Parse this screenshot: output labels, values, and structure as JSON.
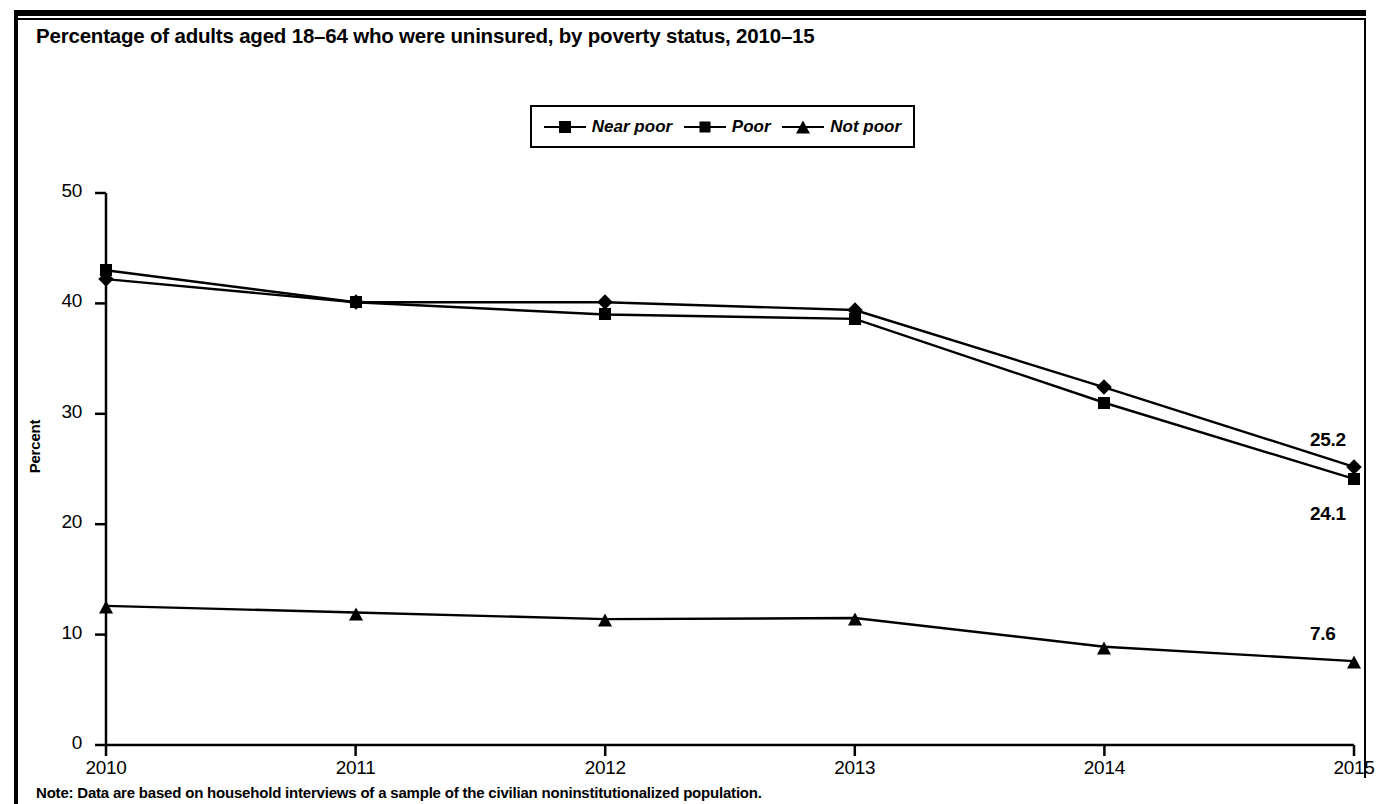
{
  "figure": {
    "title": "Percentage of adults aged 18–64 who were uninsured, by poverty status, 2010–15",
    "note": "Note: Data are based on household interviews of a sample of the civilian noninstitutionalized population."
  },
  "legend": {
    "position": "top-center",
    "items": [
      {
        "label": "Near poor",
        "marker": "square-marker-icon"
      },
      {
        "label": "Poor",
        "marker": "diamond-marker-icon"
      },
      {
        "label": "Not poor",
        "marker": "triangle-marker-icon"
      }
    ]
  },
  "chart_data": {
    "type": "line",
    "title": "Percentage of adults aged 18–64 who were uninsured, by poverty status, 2010–15",
    "xlabel": "",
    "ylabel": "Percent",
    "categories": [
      "2010",
      "2011",
      "2012",
      "2013",
      "2014",
      "2015"
    ],
    "x": [
      2010,
      2011,
      2012,
      2013,
      2014,
      2015
    ],
    "ylim": [
      0,
      50
    ],
    "yticks": [
      0,
      10,
      20,
      30,
      40,
      50
    ],
    "ytick_labels": [
      "0",
      "10",
      "20",
      "30",
      "40",
      "50"
    ],
    "xtick_labels": [
      "2010",
      "2011",
      "2012",
      "2013",
      "2014",
      "2015"
    ],
    "grid": false,
    "legend_position": "top-center",
    "series": [
      {
        "name": "Near poor",
        "marker": "square",
        "values": [
          43.0,
          40.1,
          39.0,
          38.6,
          31.0,
          24.1
        ],
        "end_label": "24.1"
      },
      {
        "name": "Poor",
        "marker": "diamond",
        "values": [
          42.2,
          40.1,
          40.1,
          39.4,
          32.4,
          25.2
        ],
        "end_label": "25.2"
      },
      {
        "name": "Not poor",
        "marker": "triangle",
        "values": [
          12.6,
          12.0,
          11.4,
          11.5,
          8.9,
          7.6
        ],
        "end_label": "7.6"
      }
    ],
    "annotations": [
      {
        "text": "25.2",
        "series": "Poor",
        "x": 2015
      },
      {
        "text": "24.1",
        "series": "Near poor",
        "x": 2015
      },
      {
        "text": "7.6",
        "series": "Not poor",
        "x": 2015
      }
    ]
  },
  "colors": {
    "line": "#000000",
    "background": "#ffffff",
    "text": "#000000"
  }
}
